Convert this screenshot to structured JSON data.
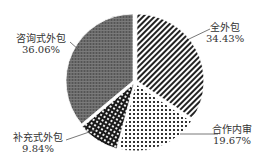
{
  "chart_data": {
    "type": "pie",
    "title": "",
    "start_angle": "12 o'clock, clockwise",
    "slices": [
      {
        "label": "全外包",
        "value": 34.43,
        "value_label": "34.43%",
        "pattern": "diagonal-stripes"
      },
      {
        "label": "合作内审",
        "value": 19.67,
        "value_label": "19.67%",
        "pattern": "dots"
      },
      {
        "label": "补充式外包",
        "value": 9.84,
        "value_label": "9.84%",
        "pattern": "dark-checker"
      },
      {
        "label": "咨询式外包",
        "value": 36.06,
        "value_label": "36.06%",
        "pattern": "dark-crosshatch"
      }
    ],
    "legend": "none (leader-line labels)"
  },
  "labels": {
    "s0": {
      "name": "全外包",
      "pct": "34.43%"
    },
    "s1": {
      "name": "合作内审",
      "pct": "19.67%"
    },
    "s2": {
      "name": "补充式外包",
      "pct": "9.84%"
    },
    "s3": {
      "name": "咨询式外包",
      "pct": "36.06%"
    }
  }
}
